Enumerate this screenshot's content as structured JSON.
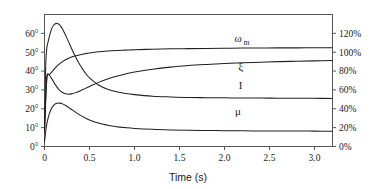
{
  "chart_data": {
    "type": "line",
    "title": "",
    "xlabel": "Time (s)",
    "ylabel": "",
    "xlim": [
      0,
      3.2
    ],
    "ylim": [
      0,
      70
    ],
    "grid": false,
    "legend": "inline-curve-labels",
    "x_ticks": [
      "0",
      "0.5",
      "1.0",
      "1.5",
      "2.0",
      "2.5",
      "3.0"
    ],
    "x_tick_values": [
      0,
      0.5,
      1.0,
      1.5,
      2.0,
      2.5,
      3.0
    ],
    "y_left_ticks": [
      "0°",
      "10°",
      "20°",
      "30°",
      "40°",
      "50°",
      "60°"
    ],
    "y_left_tick_values": [
      0,
      10,
      20,
      30,
      40,
      50,
      60
    ],
    "y_left_unit": "degrees",
    "y_right_ticks": [
      "0%",
      "20%",
      "40%",
      "60%",
      "80%",
      "100%",
      "120%"
    ],
    "y_right_tick_values": [
      0,
      20,
      40,
      60,
      80,
      100,
      120
    ],
    "y_right_unit": "percent",
    "y_right_lim": [
      0,
      140
    ],
    "curve_color": "#231f20",
    "frame_color": "#58585b",
    "series": [
      {
        "name": "ωm",
        "label": "ω",
        "label_sub": "m",
        "label_x": 2.15,
        "label_y": 55.5,
        "axis": "left",
        "x": [
          0,
          0.01,
          0.02,
          0.03,
          0.04,
          0.05,
          0.06,
          0.08,
          0.1,
          0.13,
          0.16,
          0.2,
          0.25,
          0.3,
          0.35,
          0.4,
          0.45,
          0.5,
          0.6,
          0.7,
          0.8,
          0.9,
          1.0,
          1.2,
          1.4,
          1.6,
          1.8,
          2.0,
          2.2,
          2.4,
          2.6,
          2.8,
          3.0,
          3.2
        ],
        "y": [
          8.0,
          22.0,
          33.0,
          38.0,
          38.4,
          38.2,
          38.4,
          39.4,
          40.6,
          42.2,
          43.5,
          45.0,
          46.4,
          47.4,
          48.1,
          48.7,
          49.2,
          49.6,
          50.2,
          50.6,
          50.9,
          51.1,
          51.3,
          51.6,
          51.8,
          51.9,
          52.0,
          52.1,
          52.2,
          52.25,
          52.3,
          52.3,
          52.35,
          52.4
        ]
      },
      {
        "name": "ξ",
        "label": "ξ",
        "label_sub": "",
        "label_x": 2.18,
        "label_y": 40.5,
        "axis": "left",
        "x": [
          0,
          0.01,
          0.02,
          0.03,
          0.05,
          0.08,
          0.12,
          0.16,
          0.2,
          0.25,
          0.3,
          0.35,
          0.4,
          0.45,
          0.5,
          0.6,
          0.7,
          0.8,
          0.9,
          1.0,
          1.2,
          1.4,
          1.6,
          1.8,
          2.0,
          2.2,
          2.4,
          2.6,
          2.8,
          3.0,
          3.2
        ],
        "y": [
          8.0,
          20.0,
          31.0,
          37.5,
          38.0,
          36.0,
          32.8,
          30.2,
          28.6,
          27.8,
          27.9,
          28.6,
          29.6,
          30.7,
          31.8,
          34.0,
          35.8,
          37.3,
          38.5,
          39.5,
          41.0,
          42.1,
          42.9,
          43.5,
          44.0,
          44.4,
          44.7,
          45.0,
          45.2,
          45.4,
          45.6
        ]
      },
      {
        "name": "I",
        "label": "I",
        "label_sub": "",
        "label_x": 2.18,
        "label_y": 30.5,
        "axis": "left",
        "x": [
          0,
          0.008,
          0.015,
          0.025,
          0.04,
          0.06,
          0.08,
          0.1,
          0.13,
          0.16,
          0.18,
          0.2,
          0.24,
          0.28,
          0.32,
          0.36,
          0.4,
          0.45,
          0.5,
          0.6,
          0.7,
          0.8,
          0.9,
          1.0,
          1.2,
          1.4,
          1.6,
          1.8,
          2.0,
          2.2,
          2.4,
          2.6,
          2.8,
          3.0,
          3.2
        ],
        "y": [
          8.0,
          30.0,
          45.0,
          52.0,
          55.5,
          59.5,
          62.5,
          64.3,
          65.3,
          64.8,
          63.8,
          62.3,
          58.4,
          54.2,
          50.0,
          46.2,
          42.8,
          39.2,
          36.4,
          32.6,
          30.4,
          29.0,
          28.1,
          27.5,
          26.7,
          26.3,
          26.0,
          25.9,
          25.8,
          25.7,
          25.7,
          25.6,
          25.6,
          25.55,
          25.5
        ]
      },
      {
        "name": "μ",
        "label": "μ",
        "label_sub": "",
        "label_x": 2.15,
        "label_y": 16.5,
        "axis": "left",
        "x": [
          0,
          0.01,
          0.02,
          0.04,
          0.06,
          0.08,
          0.11,
          0.14,
          0.17,
          0.2,
          0.24,
          0.28,
          0.32,
          0.36,
          0.4,
          0.45,
          0.5,
          0.6,
          0.7,
          0.8,
          0.9,
          1.0,
          1.2,
          1.4,
          1.6,
          1.8,
          2.0,
          2.2,
          2.4,
          2.6,
          2.8,
          3.0,
          3.2
        ],
        "y": [
          2.5,
          6.5,
          10.5,
          15.0,
          18.2,
          20.4,
          22.2,
          22.9,
          23.0,
          22.6,
          21.6,
          20.3,
          19.0,
          17.7,
          16.5,
          15.2,
          14.1,
          12.4,
          11.3,
          10.5,
          10.0,
          9.6,
          9.1,
          8.8,
          8.6,
          8.5,
          8.4,
          8.3,
          8.25,
          8.2,
          8.2,
          8.15,
          8.1
        ]
      }
    ]
  },
  "axis": {
    "x_title": "Time (s)"
  }
}
